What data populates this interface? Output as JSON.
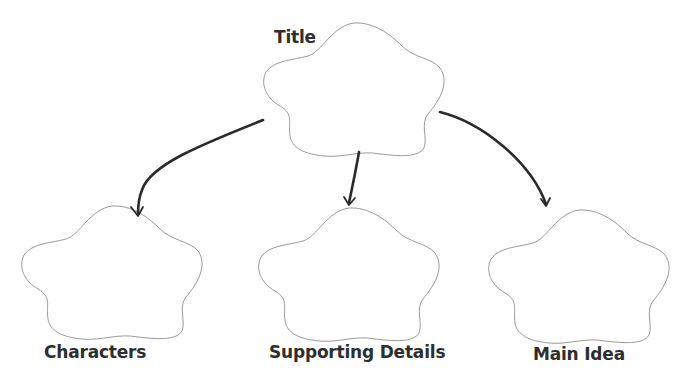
{
  "diagram": {
    "type": "graphic-organizer",
    "colors": {
      "background": "#ffffff",
      "shape_stroke": "#9a9a9a",
      "arrow": "#2a2a2a",
      "label_text": "#2e2e2e"
    },
    "root": {
      "id": "title",
      "label": "Title",
      "shape": "flower-cloud"
    },
    "children": [
      {
        "id": "characters",
        "label": "Characters",
        "shape": "flower-cloud"
      },
      {
        "id": "supporting-details",
        "label": "Supporting Details",
        "shape": "flower-cloud"
      },
      {
        "id": "main-idea",
        "label": "Main Idea",
        "shape": "flower-cloud"
      }
    ],
    "edges": [
      {
        "from": "title",
        "to": "characters"
      },
      {
        "from": "title",
        "to": "supporting-details"
      },
      {
        "from": "title",
        "to": "main-idea"
      }
    ]
  }
}
